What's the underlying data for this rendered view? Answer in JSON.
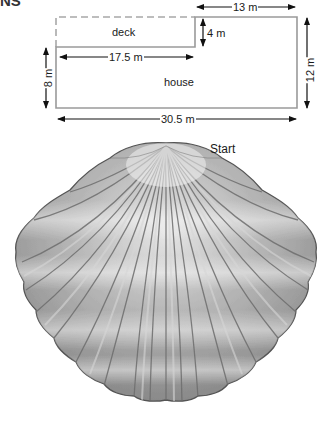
{
  "heading_fragment": "NS",
  "floor_plan": {
    "regions": {
      "deck": "deck",
      "house": "house"
    },
    "dimensions": {
      "top_right_width": "13 m",
      "notch_height": "4 m",
      "deck_width": "17.5 m",
      "left_height": "8 m",
      "right_height": "12 m",
      "total_width": "30.5 m"
    }
  },
  "shell": {
    "label_start": "Start",
    "description": "scallop seashell illustration"
  },
  "colors": {
    "outline": "#9a9a9a",
    "arrow": "#111111",
    "shell_body": "#a8a8a8",
    "shell_rib": "#6e6e6e"
  }
}
